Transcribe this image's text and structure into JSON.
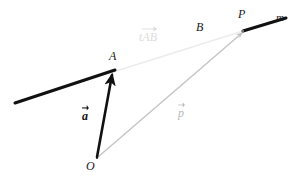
{
  "figure": {
    "type": "vector-geometry-diagram",
    "background_color": "#ffffff",
    "width": 297,
    "height": 176,
    "points": {
      "O": {
        "label": "O",
        "x": 97,
        "y": 158,
        "label_x": 88,
        "label_y": 162
      },
      "A": {
        "label": "A",
        "x": 113,
        "y": 72,
        "label_x": 109,
        "label_y": 56
      },
      "B": {
        "label": "B",
        "x": 197,
        "y": 46,
        "label_x": 196,
        "label_y": 22
      },
      "P": {
        "label": "P",
        "x": 243,
        "y": 31,
        "label_x": 239,
        "label_y": 10
      }
    },
    "line_label": {
      "label": "m",
      "x": 277,
      "y": 14
    },
    "vectors": [
      {
        "name": "a",
        "label": "a",
        "style": "bold-black",
        "color": "#111111",
        "from": "O",
        "to": "A",
        "label_x": 82,
        "label_y": 110
      },
      {
        "name": "p",
        "label": "p",
        "style": "gray",
        "color": "#b9b9b9",
        "from": "O",
        "to": "P",
        "label_x": 178,
        "label_y": 108
      }
    ],
    "segment_label": {
      "scalar": "t",
      "vector": "AB",
      "color": "#dcdcdc",
      "label_x": 140,
      "label_y": 32
    },
    "strokes": {
      "ray_color": "#111111",
      "ray_width": 3,
      "guide_color": "#ececec",
      "guide_width": 1.6,
      "vector_p_color": "#c4c4c4",
      "vector_p_width": 1.4,
      "vector_a_color": "#111111",
      "vector_a_width": 2.6
    },
    "geometry": {
      "left_ray_start": {
        "x": 15,
        "y": 103
      },
      "right_ray_end": {
        "x": 286,
        "y": 18
      }
    }
  }
}
